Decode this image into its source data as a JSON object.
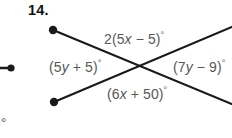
{
  "figure": {
    "problem_number": "14.",
    "line_color": "#1a1a1a",
    "label_color": "#585858",
    "background": "#ffffff",
    "width": 232,
    "height": 138
  },
  "labels": {
    "top": "2(5x − 5)°",
    "left": "(5y + 5)°",
    "right": "(7y − 9)°",
    "bottom": "(6x + 50)°"
  },
  "label_parts": {
    "top": {
      "pre": "2(5",
      "var": "x",
      "post": " − 5)",
      "deg": "°"
    },
    "left": {
      "pre": "(5",
      "var": "y",
      "post": " + 5)",
      "deg": "°"
    },
    "right": {
      "pre": "(7",
      "var": "y",
      "post": " − 9)",
      "deg": "°"
    },
    "bottom": {
      "pre": "(6",
      "var": "x",
      "post": " + 50)",
      "deg": "°"
    }
  },
  "neighbor": {
    "degree_fragment": ")°"
  },
  "geometry": {
    "intersection": {
      "x": 147,
      "y": 68
    },
    "line_a": {
      "from": {
        "x": 53,
        "y": 30
      },
      "to": {
        "x": 232,
        "y": 104
      },
      "endpoint_dot": "upper-left"
    },
    "line_b": {
      "from": {
        "x": 54,
        "y": 102
      },
      "to": {
        "x": 232,
        "y": 27
      },
      "endpoint_dot": "lower-left"
    },
    "neighbor_ray": {
      "from": {
        "x": -10,
        "y": 68
      },
      "to": {
        "x": 13,
        "y": 68
      },
      "endpoint_dot": "right"
    }
  }
}
